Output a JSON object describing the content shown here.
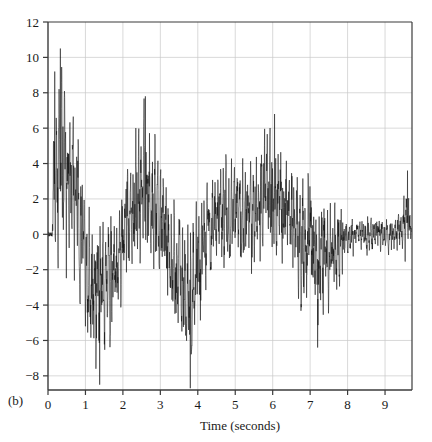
{
  "figure": {
    "panel_label": "(b)",
    "background_color": "#ffffff",
    "trace_color": "#101010",
    "axis_color": "#3b3b3b",
    "grid_color": "#c9c9c9"
  },
  "chart_data": {
    "type": "line",
    "title": "",
    "subtitle": "",
    "xlabel": "Time (seconds)",
    "ylabel": "",
    "xlim": [
      0,
      9.72
    ],
    "ylim": [
      -8.8,
      12
    ],
    "grid": true,
    "legend": null,
    "annotations": [
      "(b)"
    ],
    "xticks": [
      0,
      1,
      2,
      3,
      4,
      5,
      6,
      7,
      8,
      9
    ],
    "xtick_labels": [
      "0",
      "1",
      "2",
      "3",
      "4",
      "5",
      "6",
      "7",
      "8",
      "9"
    ],
    "yticks": [
      -8,
      -6,
      -4,
      -2,
      0,
      2,
      4,
      6,
      8,
      10,
      12
    ],
    "ytick_labels": [
      "-8",
      "-6",
      "-4",
      "-2",
      "0",
      "2",
      "4",
      "6",
      "8",
      "10",
      "12"
    ],
    "series": [
      {
        "name": "signal",
        "description": "High-frequency oscillating seismogram-like waveform, amplitude decaying after 8 s",
        "sample_rate_hz": 200,
        "envelope_x": [
          0.0,
          0.18,
          0.35,
          0.55,
          0.8,
          1.0,
          1.15,
          1.3,
          1.5,
          1.7,
          1.9,
          2.1,
          2.35,
          2.6,
          2.85,
          3.1,
          3.35,
          3.6,
          3.8,
          3.95,
          4.2,
          4.45,
          4.7,
          4.95,
          5.2,
          5.5,
          5.8,
          6.05,
          6.3,
          6.6,
          6.9,
          7.2,
          7.5,
          7.75,
          8.0,
          8.2,
          8.6,
          9.0,
          9.4,
          9.6,
          9.72
        ],
        "envelope_upper": [
          0.2,
          9.2,
          10.5,
          8.2,
          6.5,
          3.2,
          1.8,
          1.4,
          1.2,
          1.0,
          2.2,
          4.2,
          6.9,
          7.8,
          6.2,
          4.2,
          2.6,
          1.6,
          1.2,
          1.8,
          3.2,
          4.2,
          4.6,
          4.2,
          4.9,
          5.2,
          6.0,
          6.8,
          5.4,
          4.4,
          3.6,
          2.6,
          3.2,
          2.0,
          1.0,
          1.2,
          1.1,
          1.0,
          1.3,
          3.6,
          0.4
        ],
        "envelope_lower": [
          -0.2,
          -1.6,
          -2.2,
          -2.6,
          -3.4,
          -5.2,
          -7.1,
          -7.6,
          -7.0,
          -6.2,
          -4.4,
          -3.2,
          -2.4,
          -2.2,
          -2.8,
          -3.6,
          -5.4,
          -7.4,
          -8.7,
          -6.4,
          -3.2,
          -2.4,
          -2.0,
          -2.2,
          -2.4,
          -2.2,
          -2.0,
          -2.2,
          -2.6,
          -3.6,
          -5.0,
          -6.4,
          -4.6,
          -3.4,
          -1.4,
          -1.2,
          -1.2,
          -1.1,
          -1.4,
          -1.6,
          -0.4
        ],
        "key_peaks": [
          {
            "x": 0.33,
            "y": 10.5
          },
          {
            "x": 0.18,
            "y": 9.2
          },
          {
            "x": 2.6,
            "y": 7.8
          },
          {
            "x": 6.05,
            "y": 6.8
          },
          {
            "x": 9.6,
            "y": 3.6
          }
        ],
        "key_troughs": [
          {
            "x": 1.38,
            "y": -8.5
          },
          {
            "x": 3.8,
            "y": -8.7
          },
          {
            "x": 1.28,
            "y": -7.6
          },
          {
            "x": 7.2,
            "y": -6.4
          }
        ]
      }
    ]
  }
}
